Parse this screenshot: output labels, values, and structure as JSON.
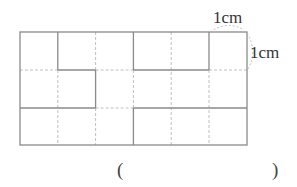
{
  "figure": {
    "grid": {
      "cols": 6,
      "rows": 3,
      "left": 20,
      "top": 32,
      "cell": 37.8
    },
    "unit_labels": {
      "horizontal": "1cm",
      "vertical": "1cm"
    },
    "answer_open": "(",
    "answer_close": ")",
    "colors": {
      "solid": "#8a8a8a",
      "dashed": "#b5b5b5",
      "text": "#333333"
    }
  }
}
